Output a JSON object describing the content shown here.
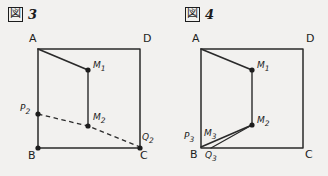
{
  "page": {
    "background_color": "#f2f1ef",
    "ink_color": "#1d1d1d",
    "width": 328,
    "height": 176
  },
  "figures": [
    {
      "id": "figure-3",
      "caption": {
        "mark_glyph": "図",
        "mark_name": "figure-mark-box",
        "number": "3"
      },
      "quad": {
        "A": [
          38,
          49
        ],
        "B": [
          38,
          148
        ],
        "C": [
          140,
          148
        ],
        "D": [
          140,
          49
        ]
      },
      "points": [
        {
          "name": "M1",
          "label": "M",
          "sub": "1",
          "x": 88,
          "y": 70,
          "label_dx": 5,
          "label_dy": -10
        },
        {
          "name": "M2",
          "label": "M",
          "sub": "2",
          "x": 88,
          "y": 126,
          "label_dx": 5,
          "label_dy": -14
        },
        {
          "name": "P2",
          "label": "P",
          "sub": "2",
          "x": 38,
          "y": 114,
          "label_dx": -16,
          "label_dy": -11
        },
        {
          "name": "Q2",
          "label": "Q",
          "sub": "2",
          "x": 140,
          "y": 148,
          "label_dx": 3,
          "label_dy": -16
        }
      ],
      "solid_segments": [
        {
          "name": "segment-A-M1",
          "from": "A",
          "to": "M1"
        },
        {
          "name": "segment-M1-M2",
          "from": "M1",
          "to": "M2"
        }
      ],
      "dashed_segments": [
        {
          "name": "segment-P2-M2-Q2-dashed",
          "path": "P2-M2-Q2"
        }
      ]
    },
    {
      "id": "figure-4",
      "caption": {
        "mark_glyph": "図",
        "mark_name": "figure-mark-box",
        "number": "4"
      },
      "quad": {
        "A": [
          37,
          49
        ],
        "B": [
          37,
          148
        ],
        "C": [
          139,
          148
        ],
        "D": [
          139,
          49
        ]
      },
      "points": [
        {
          "name": "M1",
          "label": "M",
          "sub": "1",
          "x": 88,
          "y": 70,
          "label_dx": 5,
          "label_dy": -10
        },
        {
          "name": "M2",
          "label": "M",
          "sub": "2",
          "x": 88,
          "y": 125,
          "label_dx": 5,
          "label_dy": -10
        },
        {
          "name": "P3",
          "label": "P",
          "sub": "3",
          "x": 37,
          "y": 134,
          "label_dx": -16,
          "label_dy": -4
        },
        {
          "name": "M3",
          "label": "M",
          "sub": "3",
          "x": 46,
          "y": 134,
          "label_dx": 2,
          "label_dy": -6
        },
        {
          "name": "Q3",
          "label": "Q",
          "sub": "3",
          "x": 46,
          "y": 148,
          "label_dx": 2,
          "label_dy": 3
        }
      ],
      "solid_segments": [
        {
          "name": "segment-A-M1",
          "from": "A",
          "to": "M1"
        },
        {
          "name": "segment-M1-M2",
          "from": "M1",
          "to": "M2"
        },
        {
          "name": "segment-M2-B",
          "from": "M2",
          "to": "B"
        },
        {
          "name": "segment-M2-Q3",
          "from": "M2",
          "to": "Q3"
        }
      ],
      "dashed_segments": []
    }
  ]
}
